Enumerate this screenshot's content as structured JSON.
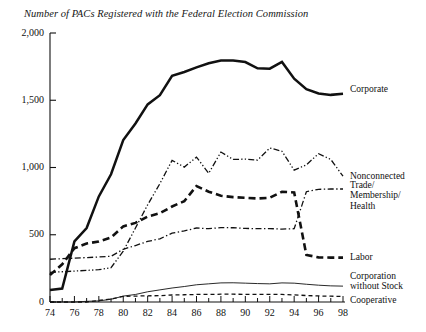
{
  "chart_data": {
    "type": "line",
    "title": "Number of PACs Registered with the Federal Election Commission",
    "xlabel": "",
    "ylabel": "",
    "xlim": [
      74,
      98
    ],
    "ylim": [
      0,
      2000
    ],
    "x": [
      74,
      75,
      76,
      77,
      78,
      79,
      80,
      81,
      82,
      83,
      84,
      85,
      86,
      87,
      88,
      89,
      90,
      91,
      92,
      93,
      94,
      95,
      96,
      97,
      98
    ],
    "x_tick_labels": [
      "74",
      "76",
      "78",
      "80",
      "82",
      "84",
      "86",
      "88",
      "90",
      "92",
      "94",
      "96",
      "98"
    ],
    "y_ticks": [
      0,
      500,
      1000,
      1500,
      2000
    ],
    "y_tick_labels": [
      "0",
      "500",
      "1,000",
      "1,500",
      "2,000"
    ],
    "grid": false,
    "legend_position": "right-inline",
    "series": [
      {
        "name": "Corporate",
        "style": "solid-thick",
        "label_value_at_end": 1548,
        "values": [
          89,
          100,
          450,
          550,
          785,
          950,
          1204,
          1327,
          1469,
          1538,
          1682,
          1710,
          1744,
          1775,
          1796,
          1795,
          1784,
          1738,
          1735,
          1785,
          1660,
          1582,
          1550,
          1540,
          1548
        ]
      },
      {
        "name": "Nonconnected",
        "style": "dash-dot-dot-thin",
        "label_value_at_end": 935,
        "values": [
          220,
          225,
          230,
          235,
          240,
          255,
          378,
          550,
          723,
          880,
          1053,
          1003,
          1077,
          957,
          1115,
          1060,
          1062,
          1055,
          1145,
          1121,
          980,
          1020,
          1103,
          1060,
          935
        ]
      },
      {
        "name": "Trade/\nMembership/\nHealth",
        "style": "dash-dot-thin",
        "label_value_at_end": 840,
        "values": [
          318,
          322,
          326,
          330,
          335,
          340,
          392,
          420,
          450,
          470,
          512,
          528,
          550,
          545,
          553,
          552,
          547,
          545,
          546,
          542,
          545,
          820,
          838,
          840,
          840
        ]
      },
      {
        "name": "Labor",
        "style": "dash-thick",
        "label_value_at_end": 330,
        "values": [
          201,
          280,
          400,
          435,
          450,
          480,
          562,
          588,
          635,
          660,
          710,
          750,
          862,
          820,
          790,
          780,
          775,
          770,
          775,
          820,
          815,
          350,
          332,
          330,
          330
        ]
      },
      {
        "name": "Corporation\nwithout Stock",
        "style": "solid-thin",
        "label_value_at_end": 118,
        "values": [
          0,
          0,
          0,
          5,
          8,
          20,
          44,
          56,
          76,
          90,
          104,
          115,
          128,
          135,
          142,
          143,
          140,
          137,
          135,
          142,
          140,
          132,
          125,
          120,
          118
        ]
      },
      {
        "name": "Cooperative",
        "style": "dash-small-thin",
        "label_value_at_end": 42,
        "values": [
          0,
          0,
          0,
          0,
          12,
          22,
          42,
          44,
          46,
          47,
          52,
          54,
          56,
          56,
          58,
          58,
          57,
          56,
          56,
          56,
          53,
          48,
          45,
          43,
          42
        ]
      }
    ]
  },
  "legend_labels": {
    "corporate": "Corporate",
    "nonconnected": "Nonconnected",
    "trade": "Trade/\nMembership/\nHealth",
    "labor": "Labor",
    "corporation_without_stock": "Corporation\nwithout Stock",
    "cooperative": "Cooperative"
  },
  "colors": {
    "line": "#111111",
    "axis": "#111111",
    "background": "#ffffff"
  }
}
